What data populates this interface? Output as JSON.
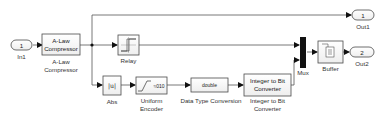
{
  "diagram": {
    "type": "simulink-model",
    "ports": {
      "in1": {
        "number": "1",
        "label": "In1"
      },
      "out1": {
        "number": "1",
        "label": "Out1"
      },
      "out2": {
        "number": "2",
        "label": "Out2"
      }
    },
    "blocks": {
      "alaw": {
        "text_line1": "A-Law",
        "text_line2": "Compressor",
        "label_line1": "A-Law",
        "label_line2": "Compressor"
      },
      "relay": {
        "label": "Relay"
      },
      "abs": {
        "text": "|u|",
        "label": "Abs"
      },
      "uniform_encoder": {
        "text": "≈010",
        "label_line1": "Uniform",
        "label_line2": "Encoder"
      },
      "dtc": {
        "text": "double",
        "label": "Data Type Conversion"
      },
      "int2bit": {
        "text_line1": "Integer to Bit",
        "text_line2": "Converter",
        "label_line1": "Integer to Bit",
        "label_line2": "Converter"
      },
      "mux": {
        "label": "Mux"
      },
      "buffer": {
        "label": "Buffer"
      }
    },
    "colors": {
      "line": "#555555",
      "block_border": "#4a4a4a",
      "mux_fill": "#111111"
    }
  }
}
